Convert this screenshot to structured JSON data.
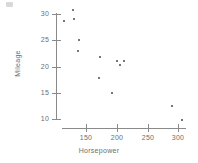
{
  "chart_data": {
    "type": "scatter",
    "title": "",
    "xlabel": "Horsepower",
    "ylabel": "Mileage",
    "xlim": [
      100,
      320
    ],
    "ylim": [
      8,
      32
    ],
    "xticks": [
      150,
      200,
      250,
      300
    ],
    "xtick_labels": [
      "150",
      "200",
      "250",
      "300"
    ],
    "yticks": [
      10,
      15,
      20,
      25,
      30
    ],
    "ytick_labels": [
      "10",
      "15",
      "20",
      "25",
      "30"
    ],
    "grid": false,
    "legend": "none",
    "marker": "dot",
    "marker_color": "#4a4a4a",
    "axis_color": "#8a8a8a",
    "points": [
      {
        "x": 128,
        "y": 30.8
      },
      {
        "x": 114,
        "y": 28.7
      },
      {
        "x": 130,
        "y": 29.0
      },
      {
        "x": 139,
        "y": 25.0
      },
      {
        "x": 137,
        "y": 22.9
      },
      {
        "x": 173,
        "y": 21.8
      },
      {
        "x": 171,
        "y": 17.8
      },
      {
        "x": 201,
        "y": 21.0
      },
      {
        "x": 212,
        "y": 21.0
      },
      {
        "x": 205,
        "y": 20.2
      },
      {
        "x": 193,
        "y": 15.0
      },
      {
        "x": 290,
        "y": 12.4
      },
      {
        "x": 307,
        "y": 9.9
      }
    ]
  },
  "axes": {
    "x_title": "Horsepower",
    "y_title": "Mileage"
  }
}
